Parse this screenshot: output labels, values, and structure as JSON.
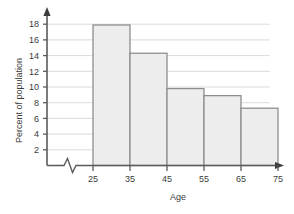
{
  "chart_data": {
    "type": "bar",
    "title": "",
    "subtitle": "",
    "xlabel": "Age",
    "ylabel": "Percent of population",
    "categories": [
      "25-35",
      "35-45",
      "45-55",
      "55-65",
      "65-75"
    ],
    "bin_edges": [
      25,
      35,
      45,
      55,
      65,
      75
    ],
    "values": [
      17.9,
      14.3,
      9.8,
      8.9,
      7.3
    ],
    "series": [
      {
        "name": "Percent of population",
        "values": [
          17.9,
          14.3,
          9.8,
          8.9,
          7.3
        ]
      }
    ],
    "xlim": [
      25,
      75
    ],
    "ylim": [
      0,
      19
    ],
    "x_ticks": [
      25,
      35,
      45,
      55,
      65,
      75
    ],
    "x_tick_labels": [
      "25",
      "35",
      "45",
      "55",
      "65",
      "75"
    ],
    "y_ticks": [
      2,
      4,
      6,
      8,
      10,
      12,
      14,
      16,
      18
    ],
    "y_tick_labels": [
      "2",
      "4",
      "6",
      "8",
      "10",
      "12",
      "14",
      "16",
      "18"
    ],
    "grid": "horizontal",
    "legend": "none",
    "x_axis_break": true,
    "bar_fill_color": "#ededed",
    "bar_border_color": "#8e8e8e",
    "gridline_color": "#d2d2d2",
    "axis_color": "#5a5a5a",
    "text_color": "#3b3b3b",
    "background_color": "#ffffff"
  },
  "axes": {
    "y_title": "Percent of population",
    "x_title": "Age"
  },
  "y_tick_labels": {
    "t18": "18",
    "t16": "16",
    "t14": "14",
    "t12": "12",
    "t10": "10",
    "t8": "8",
    "t6": "6",
    "t4": "4",
    "t2": "2"
  },
  "x_tick_labels": {
    "t25": "25",
    "t35": "35",
    "t45": "45",
    "t55": "55",
    "t65": "65",
    "t75": "75"
  }
}
